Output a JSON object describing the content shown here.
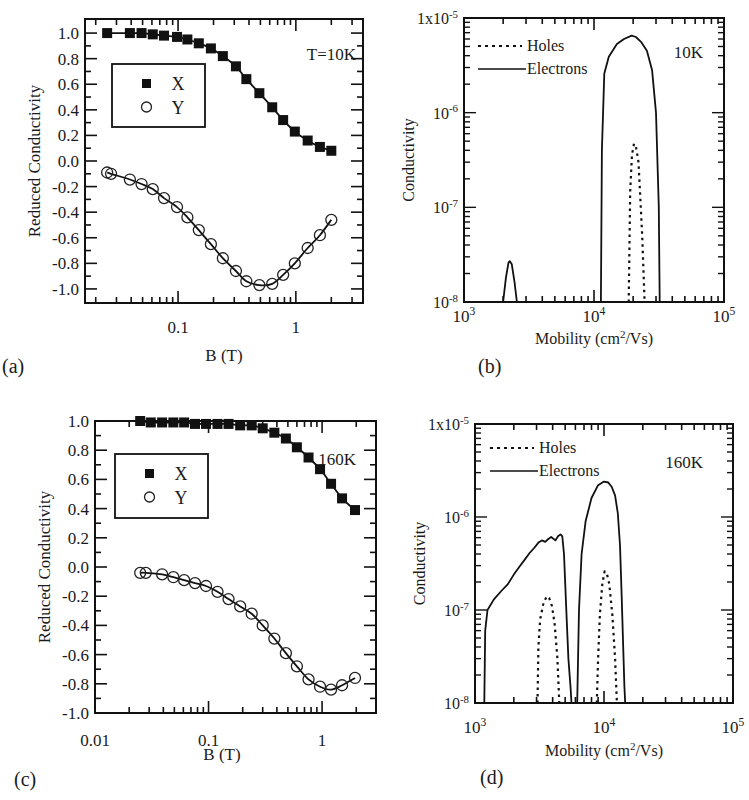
{
  "panels": {
    "a": {
      "label": "(a)",
      "annotation": "T=10K",
      "ylabel": "Reduced Conductivity",
      "xlabel": "B (T)",
      "xticks": [
        "0.1",
        "1"
      ],
      "yticks": [
        "1.0",
        "0.8",
        "0.6",
        "0.4",
        "0.2",
        "0.0",
        "-0.2",
        "-0.4",
        "-0.6",
        "-0.8",
        "-1.0"
      ],
      "legend": [
        "X",
        "Y"
      ]
    },
    "b": {
      "label": "(b)",
      "annotation": "10K",
      "ylabel": "Conductivity",
      "xlabel": "Mobility (cm²/Vs)",
      "legend": [
        "Holes",
        "Electrons"
      ]
    },
    "c": {
      "label": "(c)",
      "annotation": "160K",
      "ylabel": "Reduced Conductivity",
      "xlabel": "B (T)",
      "xticks": [
        "0.01",
        "0.1",
        "1"
      ],
      "yticks": [
        "1.0",
        "0.8",
        "0.6",
        "0.4",
        "0.2",
        "0.0",
        "-0.2",
        "-0.4",
        "-0.6",
        "-0.8",
        "-1.0"
      ],
      "legend": [
        "X",
        "Y"
      ]
    },
    "d": {
      "label": "(d)",
      "annotation": "160K",
      "ylabel": "Conductivity",
      "xlabel": "Mobility (cm²/Vs)",
      "legend": [
        "Holes",
        "Electrons"
      ]
    }
  },
  "chart_data": [
    {
      "id": "a",
      "type": "scatter",
      "title": "T=10K",
      "xlabel": "B (T)",
      "ylabel": "Reduced Conductivity",
      "xscale": "log",
      "xlim": [
        0.016,
        3.7
      ],
      "ylim": [
        -1.0,
        1.0
      ],
      "series": [
        {
          "name": "X",
          "marker": "filled-square",
          "line": "solid",
          "x": [
            0.025,
            0.039,
            0.049,
            0.061,
            0.076,
            0.098,
            0.12,
            0.15,
            0.19,
            0.24,
            0.31,
            0.38,
            0.49,
            0.63,
            0.78,
            0.98,
            1.26,
            1.6,
            2.0
          ],
          "y": [
            1.0,
            1.0,
            1.0,
            0.99,
            0.98,
            0.97,
            0.95,
            0.92,
            0.88,
            0.82,
            0.74,
            0.64,
            0.53,
            0.42,
            0.32,
            0.23,
            0.16,
            0.11,
            0.08
          ]
        },
        {
          "name": "Y",
          "marker": "open-circle",
          "line": "solid",
          "x": [
            0.025,
            0.027,
            0.039,
            0.049,
            0.061,
            0.076,
            0.098,
            0.12,
            0.15,
            0.19,
            0.24,
            0.31,
            0.38,
            0.49,
            0.63,
            0.78,
            0.98,
            1.26,
            1.6,
            2.0
          ],
          "y": [
            -0.09,
            -0.1,
            -0.145,
            -0.18,
            -0.22,
            -0.29,
            -0.36,
            -0.44,
            -0.54,
            -0.65,
            -0.76,
            -0.86,
            -0.94,
            -0.97,
            -0.96,
            -0.89,
            -0.8,
            -0.68,
            -0.58,
            -0.46
          ]
        }
      ]
    },
    {
      "id": "b",
      "type": "line",
      "title": "10K",
      "xlabel": "Mobility (cm²/Vs)",
      "ylabel": "Conductivity",
      "xscale": "log",
      "yscale": "log",
      "xlim": [
        1000,
        100000
      ],
      "ylim": [
        1e-08,
        1e-05
      ],
      "xticks": [
        "10^3",
        "10^4",
        "10^5"
      ],
      "yticks": [
        "1x10^-5",
        "10^-6",
        "10^-7",
        "10^-8"
      ],
      "series": [
        {
          "name": "Electrons",
          "line": "solid",
          "x": [
            2000,
            2100,
            2200,
            2250,
            2330,
            2450,
            2550,
            11300,
            11500,
            12000,
            13000,
            15000,
            17000,
            19500,
            21000,
            23000,
            25500,
            28000,
            30000,
            31500,
            32000
          ],
          "y": [
            1e-08,
            1.8e-08,
            2.6e-08,
            2.7e-08,
            2.5e-08,
            1.6e-08,
            1e-08,
            1e-08,
            4e-07,
            2.6e-06,
            3.9e-06,
            5.3e-06,
            6e-06,
            6.5e-06,
            6.3e-06,
            5.6e-06,
            4.5e-06,
            2.8e-06,
            1e-06,
            1e-07,
            1e-08
          ]
        },
        {
          "name": "Holes",
          "line": "dotted",
          "x": [
            18500,
            19000,
            19600,
            20300,
            21000,
            22000,
            23500,
            24500
          ],
          "y": [
            1e-08,
            1.5e-07,
            3.6e-07,
            4.7e-07,
            4.4e-07,
            3e-07,
            5e-08,
            1e-08
          ]
        }
      ]
    },
    {
      "id": "c",
      "type": "scatter",
      "title": "160K",
      "xlabel": "B (T)",
      "ylabel": "Reduced Conductivity",
      "xscale": "log",
      "xlim": [
        0.01,
        3.4
      ],
      "ylim": [
        -1.0,
        1.0
      ],
      "series": [
        {
          "name": "X",
          "marker": "filled-square",
          "line": "solid",
          "x": [
            0.025,
            0.031,
            0.039,
            0.049,
            0.061,
            0.076,
            0.095,
            0.12,
            0.15,
            0.19,
            0.24,
            0.3,
            0.38,
            0.48,
            0.6,
            0.76,
            0.96,
            1.2,
            1.5,
            1.95
          ],
          "y": [
            1.0,
            0.99,
            0.99,
            0.99,
            0.99,
            0.98,
            0.98,
            0.98,
            0.98,
            0.97,
            0.97,
            0.95,
            0.92,
            0.88,
            0.82,
            0.75,
            0.67,
            0.57,
            0.47,
            0.39
          ]
        },
        {
          "name": "Y",
          "marker": "open-circle",
          "line": "solid",
          "x": [
            0.025,
            0.028,
            0.039,
            0.049,
            0.061,
            0.076,
            0.095,
            0.12,
            0.15,
            0.19,
            0.24,
            0.3,
            0.38,
            0.48,
            0.6,
            0.76,
            0.96,
            1.2,
            1.5,
            1.95
          ],
          "y": [
            -0.04,
            -0.04,
            -0.05,
            -0.07,
            -0.09,
            -0.11,
            -0.13,
            -0.17,
            -0.22,
            -0.27,
            -0.32,
            -0.4,
            -0.49,
            -0.59,
            -0.68,
            -0.77,
            -0.82,
            -0.84,
            -0.81,
            -0.76
          ]
        }
      ]
    },
    {
      "id": "d",
      "type": "line",
      "title": "160K",
      "xlabel": "Mobility (cm²/Vs)",
      "ylabel": "Conductivity",
      "xscale": "log",
      "yscale": "log",
      "xlim": [
        1000,
        100000
      ],
      "ylim": [
        1e-08,
        1e-05
      ],
      "xticks": [
        "10^3",
        "10^4",
        "10^5"
      ],
      "yticks": [
        "1x10^-5",
        "10^-6",
        "10^-7",
        "10^-8"
      ],
      "series": [
        {
          "name": "Electrons",
          "line": "solid",
          "x": [
            1180,
            1200,
            1250,
            1400,
            1600,
            1800,
            2000,
            2200,
            2400,
            2650,
            2900,
            3100,
            3300,
            3500,
            3700,
            3900,
            4200,
            4400,
            4600,
            4750,
            4900,
            5100,
            5300,
            5500,
            5600,
            6200,
            6400,
            6700,
            7200,
            8000,
            9000,
            10000,
            10800,
            11500,
            12200,
            12800,
            13300,
            13700,
            14100,
            14400,
            14600
          ],
          "y": [
            1e-08,
            6e-08,
            1e-07,
            1.3e-07,
            1.6e-07,
            1.9e-07,
            2.4e-07,
            2.9e-07,
            3.4e-07,
            4.1e-07,
            4.7e-07,
            5.3e-07,
            5.6e-07,
            5.4e-07,
            5.8e-07,
            6.1e-07,
            5.6e-07,
            6.2e-07,
            6.5e-07,
            6.2e-07,
            4e-07,
            1e-07,
            3e-08,
            1.5e-08,
            1e-08,
            1e-08,
            1e-07,
            4e-07,
            9e-07,
            1.6e-06,
            2.2e-06,
            2.4e-06,
            2.35e-06,
            2.1e-06,
            1.7e-06,
            1.1e-06,
            5e-07,
            1.5e-07,
            4e-08,
            1.5e-08,
            1e-08
          ]
        },
        {
          "name": "Holes",
          "line": "dotted",
          "x": [
            3050,
            3100,
            3200,
            3400,
            3600,
            3750,
            3950,
            4150,
            4350,
            4500
          ],
          "y": [
            1e-08,
            4e-08,
            8e-08,
            1.2e-07,
            1.4e-07,
            1.35e-07,
            1.1e-07,
            7e-08,
            3e-08,
            1e-08
          ]
        },
        {
          "name": "Holes (2nd peak)",
          "line": "dotted",
          "x": [
            8800,
            9000,
            9300,
            9700,
            10100,
            10500,
            11000,
            11600,
            12200,
            12600
          ],
          "y": [
            1e-08,
            3e-08,
            9e-08,
            1.9e-07,
            2.6e-07,
            2.5e-07,
            1.9e-07,
            9e-08,
            3e-08,
            1e-08
          ]
        }
      ]
    }
  ],
  "layout": {
    "a": {
      "box": [
        85,
        19,
        363,
        303
      ],
      "xlog": [
        -1.79,
        0.57
      ],
      "ylin": [
        -1.11,
        1.11
      ]
    },
    "b": {
      "box": [
        464,
        18,
        724,
        302
      ],
      "xlog": [
        3,
        5
      ],
      "ylog": [
        -8,
        -5
      ]
    },
    "c": {
      "box": [
        95,
        421,
        376,
        713
      ],
      "xlog": [
        -2,
        0.475
      ],
      "ylin": [
        -1.0,
        1.0
      ]
    },
    "d": {
      "box": [
        475,
        424,
        733,
        703
      ],
      "xlog": [
        3,
        5
      ],
      "ylog": [
        -8,
        -5
      ]
    }
  }
}
